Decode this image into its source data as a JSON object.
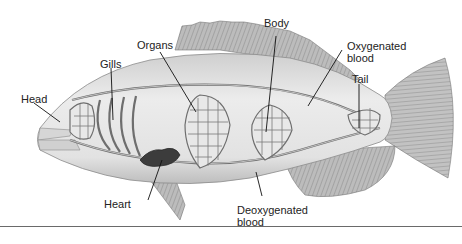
{
  "diagram": {
    "labels": {
      "head": "Head",
      "gills": "Gills",
      "organs": "Organs",
      "body": "Body",
      "oxygenated_line1": "Oxygenated",
      "oxygenated_line2": "blood",
      "tail": "Tail",
      "heart": "Heart",
      "deoxygenated_line1": "Deoxygenated",
      "deoxygenated_line2": "blood"
    },
    "colors": {
      "body_fill": "#e4e4e4",
      "fin_fill": "#b9b9b9",
      "vessel": "#6e6e6e",
      "heart": "#3c3c3c",
      "leader_line": "#111111",
      "rule": "#6a6a6a"
    }
  }
}
